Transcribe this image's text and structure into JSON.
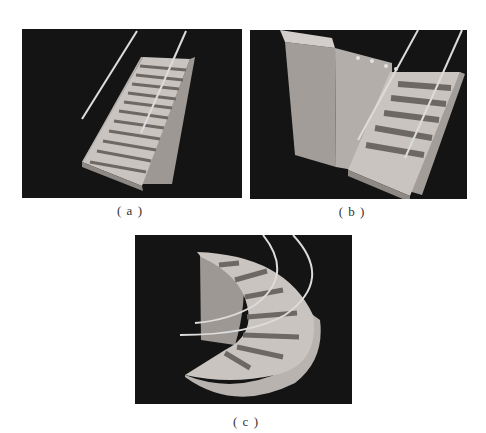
{
  "figure": {
    "panels": [
      {
        "id": "a",
        "caption": "( a )",
        "description": "straight flight staircase with two guide rods"
      },
      {
        "id": "b",
        "caption": "( b )",
        "description": "straight staircase next to a tall block with two guide rods"
      },
      {
        "id": "c",
        "caption": "( c )",
        "description": "spiral staircase with two curved rails"
      }
    ],
    "colors": {
      "background": "#141414",
      "stair_light": "#c9c4bf",
      "stair_dark": "#6d6864",
      "side_face": "#a9a4a0",
      "rod": "#dcdcdc"
    }
  }
}
